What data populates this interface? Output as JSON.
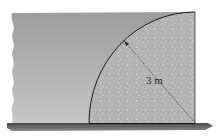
{
  "diagram": {
    "radius_label": "3 m",
    "elements": {
      "water": "water body with wavy cut-off edge on the left",
      "gate": "quarter-circular solid (concrete) section, speckled texture",
      "ground": "dark horizontal ground/base strip",
      "radius_arrow": "dimension arrow from circle center to arc"
    },
    "colors": {
      "water_top": "#9a9a9a",
      "water_bottom": "#c4c4c4",
      "gate_fill": "#b4b4b4",
      "outline": "#1a1a1a",
      "ground": "#5a5a5a"
    }
  }
}
